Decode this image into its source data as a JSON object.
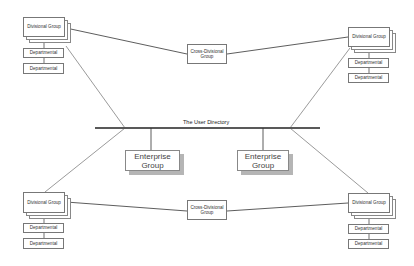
{
  "diagram": {
    "backbone": {
      "label": "The User Directory"
    },
    "enterprise_groups": [
      {
        "label_line1": "Enterprise",
        "label_line2": "Group"
      },
      {
        "label_line1": "Enterprise",
        "label_line2": "Group"
      }
    ],
    "cross_divisional": [
      {
        "label_line1": "Cross-Divisional",
        "label_line2": "Group"
      },
      {
        "label_line1": "Cross-Divisional",
        "label_line2": "Group"
      }
    ],
    "divisional_clusters": [
      {
        "position": "top-left",
        "divisional": "Divisional Group",
        "departments": [
          "Departmental",
          "Departmental"
        ]
      },
      {
        "position": "top-right",
        "divisional": "Divisional Group",
        "departments": [
          "Departmental",
          "Departmental"
        ]
      },
      {
        "position": "bottom-left",
        "divisional": "Divisional Group",
        "departments": [
          "Departmental",
          "Departmental"
        ]
      },
      {
        "position": "bottom-right",
        "divisional": "Divisional Group",
        "departments": [
          "Departmental",
          "Departmental"
        ]
      }
    ],
    "colors": {
      "line": "#333333",
      "box_border": "#777777",
      "shadow": "#b5b5b5"
    }
  }
}
